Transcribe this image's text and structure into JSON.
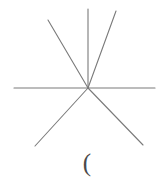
{
  "canvas": {
    "width": 168,
    "height": 180,
    "background_color": "#ffffff"
  },
  "figure": {
    "name": "six-ray-asterisk",
    "stroke_color": "#7a7a7a",
    "stroke_width": 1.1,
    "center": {
      "x": 88,
      "y": 88
    },
    "rays": [
      {
        "id": "ray-horizontal-left",
        "label": "horizontal-left",
        "x1": 14,
        "y1": 88,
        "x2": 88,
        "y2": 88
      },
      {
        "id": "ray-horizontal-right",
        "label": "horizontal-right",
        "x1": 88,
        "y1": 88,
        "x2": 155,
        "y2": 88
      },
      {
        "id": "ray-vertical-up",
        "label": "vertical-up",
        "x1": 88,
        "y1": 9,
        "x2": 88,
        "y2": 88
      },
      {
        "id": "ray-upper-left",
        "label": "upper-left-diagonal",
        "x1": 48,
        "y1": 20,
        "x2": 88,
        "y2": 88
      },
      {
        "id": "ray-upper-right",
        "label": "upper-right-diagonal",
        "x1": 116,
        "y1": 11,
        "x2": 88,
        "y2": 88
      },
      {
        "id": "ray-lower-left",
        "label": "lower-left-diagonal",
        "x1": 88,
        "y1": 88,
        "x2": 35,
        "y2": 146
      },
      {
        "id": "ray-lower-right",
        "label": "lower-right-diagonal",
        "x1": 88,
        "y1": 88,
        "x2": 143,
        "y2": 145
      }
    ]
  },
  "caption": {
    "text": "(",
    "color": "#4a4a4a"
  }
}
